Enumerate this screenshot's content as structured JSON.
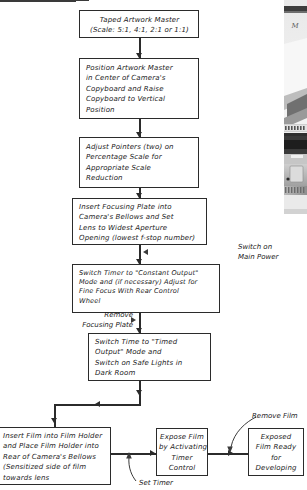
{
  "diagram": {
    "nodes": [
      {
        "id": "taped-artwork-master",
        "lines": [
          "Taped Artwork Master",
          "(Scale: 5:1, 4:1, 2:1 or 1:1)"
        ]
      },
      {
        "id": "position-artwork-master",
        "lines": [
          "Position Artwork Master",
          "in Center of Camera's",
          "Copyboard and Raise",
          "Copyboard to Vertical",
          "Position"
        ]
      },
      {
        "id": "adjust-pointers",
        "lines": [
          "Adjust Pointers (two) on",
          "Percentage Scale for",
          "Appropriate Scale",
          "Reduction"
        ]
      },
      {
        "id": "insert-focusing-plate",
        "lines": [
          "Insert Focusing Plate into",
          "Camera's Bellows and Set",
          "Lens to Widest Aperture",
          "Opening (lowest f-stop number)"
        ]
      },
      {
        "id": "switch-timer-constant-output",
        "lines": [
          "Switch Timer to \"Constant Output\"",
          "Mode and (if necessary) Adjust for",
          "Fine Focus With Rear Control",
          "Wheel"
        ]
      },
      {
        "id": "switch-time-timed-output",
        "lines": [
          "Switch Time to \"Timed",
          "Output\" Mode and",
          "Switch on Safe Lights in",
          "Dark Room"
        ]
      },
      {
        "id": "insert-film-into-holder",
        "lines": [
          "Insert Film into Film Holder",
          "and Place Film Holder into",
          "Rear of Camera's Bellows",
          "(Sensitized side of film",
          "towards lens"
        ]
      },
      {
        "id": "expose-film",
        "lines": [
          "Expose Film",
          "by Activating",
          "Timer",
          "Control"
        ]
      },
      {
        "id": "exposed-film-ready",
        "lines": [
          "Exposed",
          "Film Ready",
          "for",
          "Developing"
        ]
      }
    ],
    "annotations": [
      {
        "id": "switch-on-main-power",
        "lines": [
          "Switch on",
          "Main Power"
        ]
      },
      {
        "id": "remove-focusing-plate",
        "lines": [
          "Remove",
          "Focusing Plate"
        ]
      },
      {
        "id": "set-timer",
        "lines": [
          "Set Timer"
        ]
      },
      {
        "id": "remove-film",
        "lines": [
          "Remove Film"
        ]
      }
    ],
    "photo": {
      "id": "camera-photo-strip",
      "caption_fragment": "M"
    },
    "colors": {
      "ink": "#2b2b2b",
      "paper": "#ffffff",
      "text": "#1a1a1a"
    }
  }
}
